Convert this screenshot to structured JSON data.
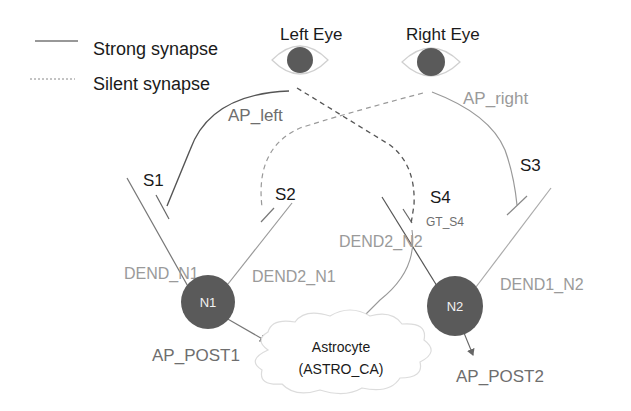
{
  "legend": {
    "strong_label": "Strong synapse",
    "silent_label": "Silent synapse"
  },
  "eyes": {
    "left": {
      "label": "Left Eye"
    },
    "right": {
      "label": "Right Eye"
    }
  },
  "pathways": {
    "ap_left": "AP_left",
    "ap_right": "AP_right"
  },
  "synapses": {
    "s1": "S1",
    "s2": "S2",
    "s3": "S3",
    "s4": "S4",
    "s4_gate": "GT_S4"
  },
  "dendrites": {
    "dend_n1": "DEND_N1",
    "dend2_n1": "DEND2_N1",
    "dend1_n2": "DEND1_N2",
    "dend2_n2": "DEND2_N2"
  },
  "neurons": {
    "n1": "N1",
    "n2": "N2"
  },
  "outputs": {
    "ap_post1": "AP_POST1",
    "ap_post2": "AP_POST2"
  },
  "astrocyte": {
    "line1": "Astrocyte",
    "line2": "(ASTRO_CA)"
  },
  "colors": {
    "neuron_fill": "#5a5a5a",
    "strong_line": "#555555",
    "silent_line": "#8a8a8a",
    "gray_label": "#9a9a9a"
  }
}
